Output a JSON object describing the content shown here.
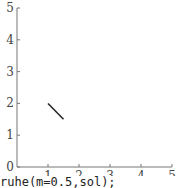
{
  "chart_data": {
    "type": "line",
    "title": "",
    "xlabel": "",
    "ylabel": "",
    "xlim": [
      0,
      5
    ],
    "ylim": [
      0,
      5
    ],
    "grid": false,
    "x_ticks": [
      "1",
      "2",
      "3",
      "4",
      "5"
    ],
    "y_ticks": [
      "0",
      "1",
      "2",
      "3",
      "4",
      "5"
    ],
    "series": [
      {
        "name": "segment",
        "x": [
          1.0,
          1.5
        ],
        "y": [
          2.0,
          1.5
        ]
      }
    ]
  },
  "colors": {
    "axis": "#777777",
    "line": "#222222",
    "text": "#444444"
  },
  "caption": "ruhe(m=0.5,sol);"
}
